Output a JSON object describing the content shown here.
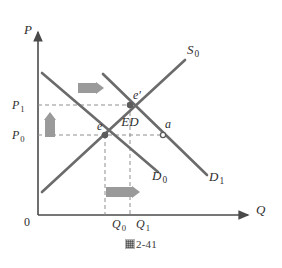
{
  "figure": {
    "caption_glyph": "圖",
    "caption_text": "2-41",
    "background_color": "#ffffff",
    "line_color": "#6b6b6b",
    "axis_color": "#555555",
    "arrow_block_color": "#9a9a9a",
    "dash_color": "#8f8f8f"
  },
  "axes": {
    "y_label": "P",
    "x_label": "Q",
    "origin_label": "0",
    "y_ticks": [
      {
        "label": "P",
        "sub": "1",
        "value_y": 105
      },
      {
        "label": "P",
        "sub": "0",
        "value_y": 135
      }
    ],
    "x_ticks": [
      {
        "label": "Q",
        "sub": "0",
        "value_x": 118
      },
      {
        "label": "Q",
        "sub": "1",
        "value_x": 142
      }
    ]
  },
  "chart_data": {
    "type": "line",
    "title": "",
    "subtitle": "",
    "xlabel": "Q",
    "ylabel": "P",
    "grid": false,
    "legend_position": "inline-curve-labels",
    "xlim": [
      0,
      250
    ],
    "ylim": [
      0,
      215
    ],
    "annotations": [
      {
        "name": "excess-demand",
        "text": "ED",
        "x": 130,
        "y": 126
      }
    ],
    "series": [
      {
        "name": "D_0",
        "label": "D",
        "sub": "0",
        "kind": "demand",
        "points": [
          [
            42,
            73
          ],
          [
            158,
            172
          ]
        ],
        "label_x": 152,
        "label_y": 180
      },
      {
        "name": "D_1",
        "label": "D",
        "sub": "1",
        "kind": "demand",
        "points": [
          [
            103,
            74
          ],
          [
            207,
            175
          ]
        ],
        "label_x": 209,
        "label_y": 181
      },
      {
        "name": "S_0",
        "label": "S",
        "sub": "0",
        "kind": "supply",
        "points": [
          [
            42,
            192
          ],
          [
            185,
            60
          ]
        ],
        "label_x": 187,
        "label_y": 54
      }
    ],
    "points": [
      {
        "name": "e",
        "label": "e",
        "x": 105,
        "y": 135,
        "label_dx": -8,
        "label_dy": -5,
        "filled": true
      },
      {
        "name": "e-prime",
        "label": "e′",
        "x": 130,
        "y": 105,
        "label_dx": 3,
        "label_dy": -6,
        "filled": true
      },
      {
        "name": "a",
        "label": "a",
        "x": 163,
        "y": 135,
        "label_dx": 2,
        "label_dy": -7,
        "filled": false
      }
    ],
    "shift_arrows": [
      {
        "name": "demand-shift-right-top",
        "direction": "right",
        "x1": 78,
        "y1": 88,
        "x2": 104,
        "y2": 88
      },
      {
        "name": "price-rise-up",
        "direction": "up",
        "x1": 50,
        "y1": 137,
        "x2": 50,
        "y2": 112
      },
      {
        "name": "quantity-increase-right",
        "direction": "right",
        "x1": 106,
        "y1": 192,
        "x2": 140,
        "y2": 192
      }
    ],
    "guide_lines": [
      {
        "name": "p1-guide",
        "orientation": "horizontal",
        "x1": 38,
        "y1": 105,
        "x2": 131,
        "y2": 105
      },
      {
        "name": "p0-guide",
        "orientation": "horizontal",
        "x1": 38,
        "y1": 135,
        "x2": 164,
        "y2": 135
      },
      {
        "name": "q0-guide",
        "orientation": "vertical",
        "x1": 105,
        "y1": 135,
        "x2": 105,
        "y2": 215
      },
      {
        "name": "q1-guide",
        "orientation": "vertical",
        "x1": 130,
        "y1": 105,
        "x2": 130,
        "y2": 215
      }
    ]
  }
}
